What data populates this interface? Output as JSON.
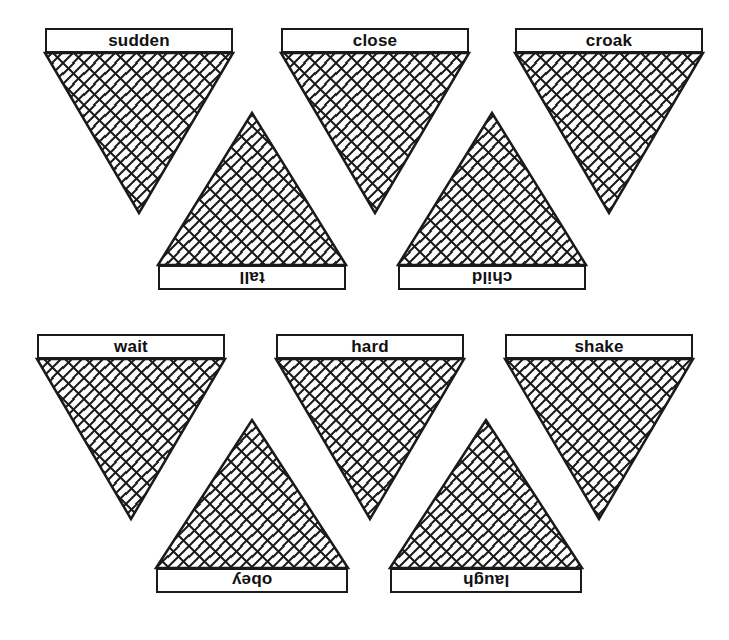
{
  "page": {
    "background_color": "#ffffff",
    "ink_color": "#1a1a1a",
    "width": 729,
    "height": 640
  },
  "style": {
    "hatch_pattern": "diamond-lattice",
    "hatch_spacing_px": 21,
    "label_border_px": 2,
    "label_font_size_px": 17
  },
  "shapes": [
    {
      "id": "shape-sudden",
      "label": "sudden",
      "orientation": "point-down",
      "label_position": "top",
      "label_rotation_deg": 0,
      "bar": {
        "x": 45,
        "y": 28,
        "w": 188,
        "h": 25
      },
      "triangle": {
        "left": 45,
        "right": 233,
        "base_y": 53,
        "apex_x": 139,
        "apex_y": 213
      }
    },
    {
      "id": "shape-close",
      "label": "close",
      "orientation": "point-down",
      "label_position": "top",
      "label_rotation_deg": 0,
      "bar": {
        "x": 281,
        "y": 28,
        "w": 188,
        "h": 25
      },
      "triangle": {
        "left": 281,
        "right": 469,
        "base_y": 53,
        "apex_x": 375,
        "apex_y": 213
      }
    },
    {
      "id": "shape-croak",
      "label": "croak",
      "orientation": "point-down",
      "label_position": "top",
      "label_rotation_deg": 0,
      "bar": {
        "x": 515,
        "y": 28,
        "w": 188,
        "h": 25
      },
      "triangle": {
        "left": 515,
        "right": 703,
        "base_y": 53,
        "apex_x": 609,
        "apex_y": 213
      }
    },
    {
      "id": "shape-tall",
      "label": "tall",
      "orientation": "point-up",
      "label_position": "bottom",
      "label_rotation_deg": 180,
      "bar": {
        "x": 158,
        "y": 265,
        "w": 188,
        "h": 25
      },
      "triangle": {
        "left": 158,
        "right": 346,
        "base_y": 265,
        "apex_x": 252,
        "apex_y": 113
      }
    },
    {
      "id": "shape-child",
      "label": "child",
      "orientation": "point-up",
      "label_position": "bottom",
      "label_rotation_deg": 180,
      "bar": {
        "x": 398,
        "y": 265,
        "w": 188,
        "h": 25
      },
      "triangle": {
        "left": 398,
        "right": 586,
        "base_y": 265,
        "apex_x": 492,
        "apex_y": 113
      }
    },
    {
      "id": "shape-wait",
      "label": "wait",
      "orientation": "point-down",
      "label_position": "top",
      "label_rotation_deg": 0,
      "bar": {
        "x": 37,
        "y": 334,
        "w": 188,
        "h": 25
      },
      "triangle": {
        "left": 37,
        "right": 225,
        "base_y": 359,
        "apex_x": 131,
        "apex_y": 519
      }
    },
    {
      "id": "shape-hard",
      "label": "hard",
      "orientation": "point-down",
      "label_position": "top",
      "label_rotation_deg": 0,
      "bar": {
        "x": 276,
        "y": 334,
        "w": 188,
        "h": 25
      },
      "triangle": {
        "left": 276,
        "right": 464,
        "base_y": 359,
        "apex_x": 370,
        "apex_y": 519
      }
    },
    {
      "id": "shape-shake",
      "label": "shake",
      "orientation": "point-down",
      "label_position": "top",
      "label_rotation_deg": 0,
      "bar": {
        "x": 505,
        "y": 334,
        "w": 188,
        "h": 25
      },
      "triangle": {
        "left": 505,
        "right": 693,
        "base_y": 359,
        "apex_x": 599,
        "apex_y": 519
      }
    },
    {
      "id": "shape-obey",
      "label": "obey",
      "orientation": "point-up",
      "label_position": "bottom",
      "label_rotation_deg": 180,
      "bar": {
        "x": 156,
        "y": 568,
        "w": 192,
        "h": 25
      },
      "triangle": {
        "left": 156,
        "right": 348,
        "base_y": 568,
        "apex_x": 252,
        "apex_y": 420
      }
    },
    {
      "id": "shape-laugh",
      "label": "laugh",
      "orientation": "point-up",
      "label_position": "bottom",
      "label_rotation_deg": 180,
      "bar": {
        "x": 390,
        "y": 568,
        "w": 192,
        "h": 25
      },
      "triangle": {
        "left": 390,
        "right": 582,
        "base_y": 568,
        "apex_x": 486,
        "apex_y": 420
      }
    }
  ]
}
